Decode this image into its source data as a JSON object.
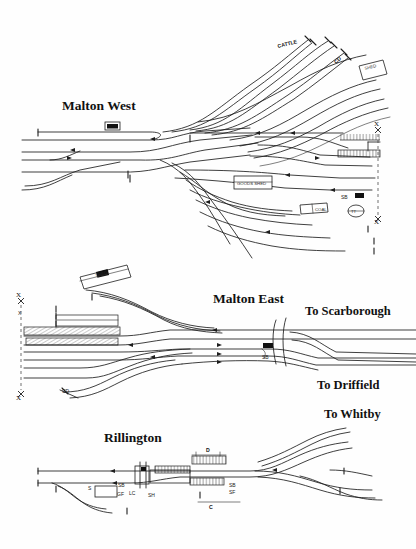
{
  "document": {
    "type": "railway-track-layout-diagram",
    "style": "hand-drawn scanned schematic",
    "sections": [
      "Malton West",
      "Malton East",
      "Rillington"
    ]
  },
  "sections": {
    "malton_west": {
      "title": "Malton West",
      "annotations": [
        {
          "id": "cattle",
          "label": "CATTLE",
          "x": 281,
          "y": 45,
          "note": "cattle dock sidings"
        },
        {
          "id": "cd-west",
          "label": "CD",
          "x": 339,
          "y": 62,
          "note": "cattle dock"
        },
        {
          "id": "shed-west",
          "label": "SHED",
          "x": 370,
          "y": 70,
          "note": "goods shed box"
        },
        {
          "id": "ms-box",
          "label": "MS",
          "x": 110,
          "y": 127,
          "note": "mess / store building"
        },
        {
          "id": "centre-box",
          "label": "GOODS SHED",
          "x": 250,
          "y": 183,
          "note": "large central building"
        },
        {
          "id": "coal-box",
          "label": "COAL",
          "x": 318,
          "y": 211,
          "note": "coal drops"
        },
        {
          "id": "sb-west",
          "label": "SB",
          "x": 346,
          "y": 197,
          "note": "signal box"
        },
        {
          "id": "eng-west",
          "label": "ENG",
          "x": 360,
          "y": 195,
          "note": "engine shed"
        },
        {
          "id": "tt-west",
          "label": "TT",
          "x": 362,
          "y": 212,
          "note": "turntable"
        },
        {
          "id": "x-top",
          "label": "X",
          "x": 379,
          "y": 130,
          "note": "layout boundary marker"
        },
        {
          "id": "x-bottom",
          "label": "X",
          "x": 379,
          "y": 219,
          "note": "layout boundary marker"
        }
      ]
    },
    "malton_east": {
      "title": "Malton East",
      "annotations": [
        {
          "id": "shed-east",
          "label": "SHED",
          "x": 101,
          "y": 277,
          "note": "tilted goods shed"
        },
        {
          "id": "x-top-e",
          "label": "X",
          "x": 21,
          "y": 302,
          "note": "layout boundary marker"
        },
        {
          "id": "bh",
          "label": "BH",
          "x": 22,
          "y": 313,
          "note": "building"
        },
        {
          "id": "cd-east",
          "label": "CD",
          "x": 66,
          "y": 391,
          "note": "cattle dock"
        },
        {
          "id": "x-bottom-e",
          "label": "X",
          "x": 21,
          "y": 395,
          "note": "layout boundary marker"
        },
        {
          "id": "sb-east",
          "label": "SB",
          "x": 266,
          "y": 356,
          "note": "signal box"
        },
        {
          "id": "eng-east",
          "label": "ENG",
          "x": 268,
          "y": 348,
          "note": "building"
        }
      ]
    },
    "rillington": {
      "title": "Rillington",
      "annotations": [
        {
          "id": "s-rill",
          "label": "S",
          "x": 92,
          "y": 488,
          "note": "station building"
        },
        {
          "id": "sb-rill-w",
          "label": "SB",
          "x": 122,
          "y": 486,
          "note": "signal box"
        },
        {
          "id": "gf-rill",
          "label": "GF",
          "x": 121,
          "y": 495,
          "note": "ground frame"
        },
        {
          "id": "lc-rill",
          "label": "LC",
          "x": 133,
          "y": 493,
          "note": "level crossing"
        },
        {
          "id": "sh-rill",
          "label": "SH",
          "x": 152,
          "y": 495,
          "note": "shed"
        },
        {
          "id": "d-rill",
          "label": "D",
          "x": 209,
          "y": 452,
          "note": "dock"
        },
        {
          "id": "sb-rill-e",
          "label": "SB",
          "x": 233,
          "y": 487,
          "note": "signal box"
        },
        {
          "id": "sf-rill",
          "label": "SF",
          "x": 233,
          "y": 494,
          "note": "signal frame"
        },
        {
          "id": "c-rill",
          "label": "C",
          "x": 212,
          "y": 506,
          "note": "coal siding"
        }
      ]
    }
  },
  "routes": [
    {
      "id": "to-scarborough",
      "label": "To Scarborough",
      "x": 310,
      "y": 312
    },
    {
      "id": "to-driffield",
      "label": "To Driffield",
      "x": 320,
      "y": 385
    },
    {
      "id": "to-whitby",
      "label": "To Whitby",
      "x": 327,
      "y": 414
    }
  ],
  "colors": {
    "ink": "#1d1d1d",
    "paper": "#fefefe",
    "faint_ink": "#565656"
  }
}
